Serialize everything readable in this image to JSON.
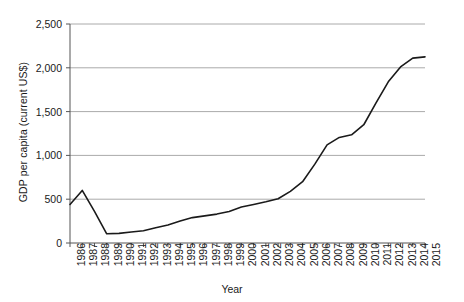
{
  "chart_data": {
    "type": "line",
    "title": "",
    "xlabel": "Year",
    "ylabel": "GDP per capita (current US$)",
    "x": [
      1986,
      1987,
      1988,
      1989,
      1990,
      1991,
      1992,
      1993,
      1994,
      1995,
      1996,
      1997,
      1998,
      1999,
      2000,
      2001,
      2002,
      2003,
      2004,
      2005,
      2006,
      2007,
      2008,
      2009,
      2010,
      2011,
      2012,
      2013,
      2014,
      2015
    ],
    "values": [
      440,
      600,
      360,
      105,
      110,
      125,
      140,
      175,
      205,
      250,
      290,
      310,
      330,
      360,
      410,
      440,
      470,
      505,
      590,
      700,
      900,
      1120,
      1205,
      1235,
      1350,
      1600,
      1840,
      2010,
      2110,
      2125
    ],
    "series": [
      {
        "name": "GDP per capita (current US$)",
        "values": [
          440,
          600,
          360,
          105,
          110,
          125,
          140,
          175,
          205,
          250,
          290,
          310,
          330,
          360,
          410,
          440,
          470,
          505,
          590,
          700,
          900,
          1120,
          1205,
          1235,
          1350,
          1600,
          1840,
          2010,
          2110,
          2125
        ]
      }
    ],
    "xlim": [
      1986,
      2015
    ],
    "ylim": [
      0,
      2500
    ],
    "ytick_values": [
      0,
      500,
      1000,
      1500,
      2000,
      2500
    ],
    "ytick_labels": [
      "0",
      "500",
      "1,000",
      "1,500",
      "2,000",
      "2,500"
    ],
    "xtick_labels": [
      "1986",
      "1987",
      "1988",
      "1989",
      "1990",
      "1991",
      "1992",
      "1993",
      "1994",
      "1995",
      "1996",
      "1997",
      "1998",
      "1999",
      "2000",
      "2001",
      "2002",
      "2003",
      "2004",
      "2005",
      "2006",
      "2007",
      "2008",
      "2009",
      "2010",
      "2011",
      "2012",
      "2013",
      "2014",
      "2015"
    ],
    "grid": "horizontal",
    "legend": "none",
    "line_color": "#1a1a1a",
    "grid_color": "#aaaaaa",
    "axis_color": "#555555",
    "background": "#ffffff"
  }
}
